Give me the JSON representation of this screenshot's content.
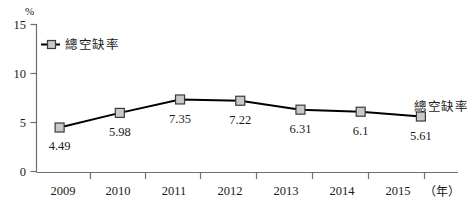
{
  "chart_data": {
    "type": "line",
    "title": "",
    "subtitle": "",
    "xlabel": "年",
    "ylabel": "%",
    "categories": [
      "2009",
      "2010",
      "2011",
      "2012",
      "2013",
      "2014",
      "2015"
    ],
    "series": [
      {
        "name": "總空缺率",
        "values": [
          4.49,
          5.98,
          7.35,
          7.22,
          6.31,
          6.1,
          5.61
        ],
        "marker": "square",
        "marker_fill": "#c9c9c9",
        "marker_stroke": "#3a3a3a",
        "line_color": "#000000"
      }
    ],
    "data_labels": [
      "4.49",
      "5.98",
      "7.35",
      "7.22",
      "6.31",
      "6.1",
      "5.61"
    ],
    "ylim": [
      0,
      15
    ],
    "yticks": [
      0,
      5,
      10,
      15
    ],
    "ytick_labels": [
      "0",
      "5",
      "10",
      "15"
    ],
    "grid": false,
    "legend": {
      "position": "top-left-inside",
      "entries": [
        "總空缺率"
      ]
    },
    "annotations": [
      {
        "text": "總空缺率",
        "anchor": "right-of-last-point"
      }
    ],
    "axis_unit_top": "%",
    "axis_unit_right": "（年）"
  },
  "colors": {
    "line": "#000000",
    "marker_fill": "#c9c9c9",
    "marker_stroke": "#3a3a3a",
    "axis": "#6f6f6f",
    "text": "#1a1a1a",
    "background": "#ffffff"
  }
}
